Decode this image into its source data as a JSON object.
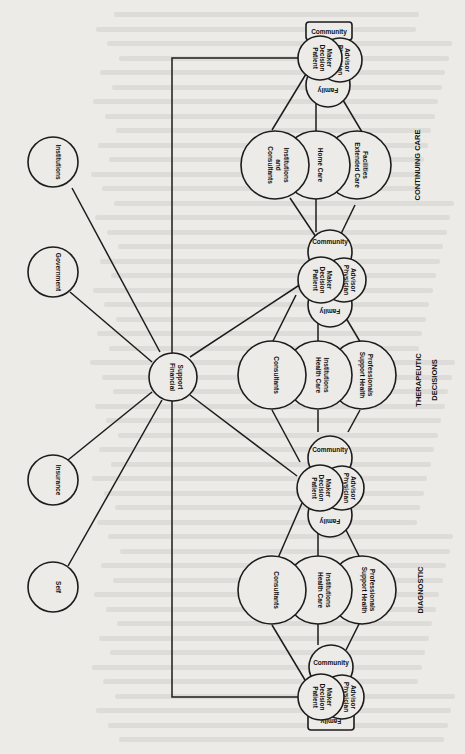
{
  "figure": {
    "orientation": "rotated-90-clockwise",
    "sections": [
      {
        "id": "continuing",
        "label": "CONTINUING CARE"
      },
      {
        "id": "therapeutic",
        "label_line1": "THERAPEUTIC",
        "label_line2": "DECISIONS"
      },
      {
        "id": "diagnostic",
        "label": "DIAGNOSTIC"
      }
    ],
    "core": {
      "patient": {
        "line1": "Patient",
        "line2": "Decision",
        "line3": "Maker"
      },
      "physician": {
        "line1": "Physician",
        "line2": "Advisor"
      },
      "community": "Community",
      "family": "Family"
    },
    "continuing_care_nodes": [
      {
        "line1": "Consultants",
        "line2": "and",
        "line3": "Institutions"
      },
      {
        "line1": "Home Care"
      },
      {
        "line1": "Extended Care",
        "line2": "Facilities"
      }
    ],
    "therapeutic_nodes": [
      {
        "line1": "Consultants"
      },
      {
        "line1": "Health Care",
        "line2": "Institutions"
      },
      {
        "line1": "Support Health",
        "line2": "Professionals"
      }
    ],
    "diagnostic_nodes": [
      {
        "line1": "Consultants"
      },
      {
        "line1": "Health Care",
        "line2": "Institutions"
      },
      {
        "line1": "Support Health",
        "line2": "Professionals"
      }
    ],
    "financial": {
      "hub": {
        "line1": "Financial",
        "line2": "Support"
      },
      "sources": [
        "Institutions",
        "Government",
        "Insurance",
        "Self"
      ]
    }
  }
}
